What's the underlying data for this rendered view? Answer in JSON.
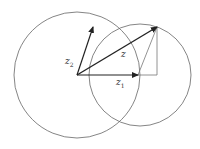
{
  "diagram": {
    "type": "complex-number vector addition",
    "labels": {
      "z": "z",
      "z1": "z",
      "z1_sub": "1",
      "z2": "z",
      "z2_sub": "2"
    },
    "colors": {
      "circle": "#666666",
      "vector": "#222222",
      "helper": "#777777",
      "text": "#333333"
    },
    "geometry": {
      "origin": [
        77,
        75
      ],
      "z1_tip": [
        138,
        75
      ],
      "z2_tip": [
        93,
        27
      ],
      "z_tip": [
        157,
        27
      ],
      "big_circle": {
        "cx": 77,
        "cy": 75,
        "r": 63
      },
      "small_circle": {
        "cx": 140,
        "cy": 75,
        "r": 51
      }
    }
  }
}
